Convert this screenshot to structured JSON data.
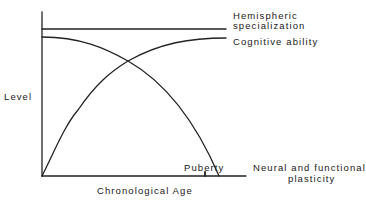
{
  "diagram": {
    "title": "",
    "y_axis_label": "Level",
    "x_axis_label": "Chronological Age",
    "marker": {
      "label": "Puberty"
    },
    "curves": [
      {
        "id": "hemispheric",
        "label_lines": [
          "Hemispheric",
          "specialization"
        ],
        "shape": "constant-high"
      },
      {
        "id": "cognitive",
        "label_lines": [
          "Cognitive ability"
        ],
        "shape": "rising-then-plateau"
      },
      {
        "id": "plasticity",
        "label_lines": [
          "Neural and functional",
          "plasticity"
        ],
        "shape": "high-then-falling-to-zero-after-puberty"
      }
    ],
    "line_color": "#222222"
  }
}
